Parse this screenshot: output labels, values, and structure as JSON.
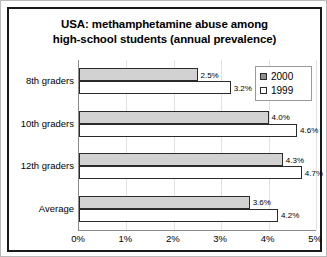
{
  "chart_data": {
    "type": "bar",
    "orientation": "horizontal",
    "title": "USA: methamphetamine abuse among high-school students (annual prevalence)",
    "title_lines": [
      "USA: methamphetamine abuse among",
      "high-school students (annual prevalence)"
    ],
    "categories": [
      "8th graders",
      "10th graders",
      "12th graders",
      "Average"
    ],
    "series": [
      {
        "name": "2000",
        "values": [
          2.5,
          4.0,
          4.3,
          3.6
        ],
        "labels": [
          "2.5%",
          "4.0%",
          "4.3%",
          "3.6%"
        ],
        "color": "#d2d2d2",
        "legend_color": "#8f8f8f"
      },
      {
        "name": "1999",
        "values": [
          3.2,
          4.6,
          4.7,
          4.2
        ],
        "labels": [
          "3.2%",
          "4.6%",
          "4.7%",
          "4.2%"
        ],
        "color": "#ffffff",
        "legend_color": "#ffffff"
      }
    ],
    "xlabel": "",
    "ylabel": "",
    "xlim": [
      0,
      5
    ],
    "xtick_values": [
      0,
      1,
      2,
      3,
      4,
      5
    ],
    "xtick_labels": [
      "0%",
      "1%",
      "2%",
      "3%",
      "4%",
      "5%"
    ],
    "grid": true,
    "grid_axis": "x",
    "legend_position": "top-right",
    "legend_entries": [
      "2000",
      "1999"
    ]
  }
}
